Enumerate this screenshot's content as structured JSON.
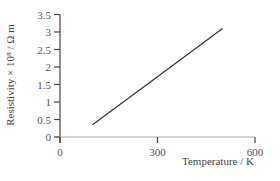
{
  "chart_data": {
    "type": "line",
    "title": "",
    "xlabel": "Temperature / K",
    "ylabel": "Resistivity × 10⁸ / Ω m",
    "xlim": [
      0,
      600
    ],
    "ylim": [
      0,
      3.5
    ],
    "x_ticks": [
      0,
      300,
      600
    ],
    "x_tick_labels": [
      "0",
      "300",
      "600"
    ],
    "y_ticks": [
      0,
      0.5,
      1,
      1.5,
      2,
      2.5,
      3,
      3.5
    ],
    "y_tick_labels": [
      "0",
      "0.5",
      "1",
      "1.5",
      "2",
      "2.5",
      "3",
      "3.5"
    ],
    "grid": false,
    "legend": null,
    "series": [
      {
        "name": "Resistivity",
        "x": [
          100,
          300,
          500
        ],
        "y": [
          0.35,
          1.72,
          3.1
        ],
        "color": "#333333"
      }
    ]
  },
  "labels": {
    "xlabel": "Temperature / K",
    "ylabel": "Resistivity × 10⁸ / Ω m"
  }
}
